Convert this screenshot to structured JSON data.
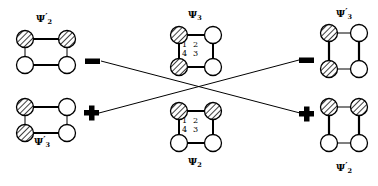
{
  "figure": {
    "title": "",
    "background": "#ffffff",
    "stroke_color": "#000000",
    "hatch_color": "#000000",
    "symbols": {
      "minus": "minus-sign",
      "plus": "plus-sign"
    }
  },
  "molecules": [
    {
      "id": "top-left",
      "label": "Ψ",
      "label_sub": "2",
      "label_prime": "′",
      "label_full": "Ψ′2",
      "shape": "wide-rectangle",
      "hatched_sites": [
        "top-left",
        "top-right"
      ],
      "open_sites": [
        "bottom-left",
        "bottom-right"
      ],
      "bold_edges": [
        "top",
        "bottom"
      ],
      "site_numbers": []
    },
    {
      "id": "bottom-left",
      "label": "Ψ",
      "label_sub": "3",
      "label_prime": "′",
      "label_full": "Ψ′3",
      "shape": "wide-rectangle",
      "hatched_sites": [
        "top-left",
        "bottom-left"
      ],
      "open_sites": [
        "top-right",
        "bottom-right"
      ],
      "bold_edges": [
        "top",
        "bottom"
      ],
      "site_numbers": []
    },
    {
      "id": "center-top",
      "label": "Ψ",
      "label_sub": "3",
      "label_prime": "",
      "label_full": "Ψ3",
      "shape": "square",
      "hatched_sites": [
        "top-left",
        "bottom-left"
      ],
      "open_sites": [
        "top-right",
        "bottom-right"
      ],
      "bold_edges": [
        "top",
        "bottom",
        "left",
        "right"
      ],
      "site_numbers": [
        "1",
        "2",
        "4",
        "3"
      ]
    },
    {
      "id": "center-bottom",
      "label": "Ψ",
      "label_sub": "2",
      "label_prime": "",
      "label_full": "Ψ2",
      "shape": "square",
      "hatched_sites": [
        "top-left",
        "top-right"
      ],
      "open_sites": [
        "bottom-left",
        "bottom-right"
      ],
      "bold_edges": [
        "top",
        "bottom",
        "left",
        "right"
      ],
      "site_numbers": [
        "1",
        "2",
        "4",
        "3"
      ]
    },
    {
      "id": "top-right",
      "label": "Ψ",
      "label_sub": "3",
      "label_prime": "′",
      "label_full": "Ψ′3",
      "shape": "tall-rectangle",
      "hatched_sites": [
        "top-left",
        "bottom-left"
      ],
      "open_sites": [
        "top-right",
        "bottom-right"
      ],
      "bold_edges": [
        "left",
        "right"
      ],
      "site_numbers": []
    },
    {
      "id": "bottom-right",
      "label": "Ψ",
      "label_sub": "2",
      "label_prime": "′",
      "label_full": "Ψ′2",
      "shape": "tall-rectangle",
      "hatched_sites": [
        "top-left",
        "top-right"
      ],
      "open_sites": [
        "bottom-left",
        "bottom-right"
      ],
      "bold_edges": [
        "left",
        "right"
      ],
      "site_numbers": []
    }
  ],
  "connectors": [
    {
      "id": "left-upper",
      "symbol": "minus",
      "symbol_text": "−",
      "from": "top-left",
      "to": "bottom-right"
    },
    {
      "id": "left-lower",
      "symbol": "plus",
      "symbol_text": "+",
      "from": "bottom-left",
      "to": "top-right"
    },
    {
      "id": "right-upper",
      "symbol": "minus",
      "symbol_text": "−",
      "from": "bottom-left",
      "to": "top-right"
    },
    {
      "id": "right-lower",
      "symbol": "plus",
      "symbol_text": "+",
      "from": "top-left",
      "to": "bottom-right"
    }
  ],
  "site_numbers_layout": {
    "top_row": [
      "1",
      "2"
    ],
    "bottom_row": [
      "4",
      "3"
    ]
  }
}
